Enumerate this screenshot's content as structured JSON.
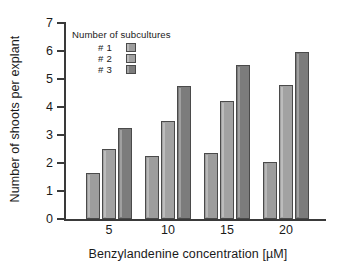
{
  "chart_data": {
    "type": "bar",
    "title": "",
    "xlabel": "Benzylandenine concentration [µM]",
    "ylabel": "Number of shoots per explant",
    "categories": [
      "5",
      "10",
      "15",
      "20"
    ],
    "series": [
      {
        "name": "# 1",
        "values": [
          1.65,
          2.25,
          2.35,
          2.05
        ],
        "color": "#9d9d9d"
      },
      {
        "name": "# 2",
        "values": [
          2.5,
          3.5,
          4.2,
          4.8
        ],
        "color": "#a2a2a2"
      },
      {
        "name": "# 3",
        "values": [
          3.25,
          4.75,
          5.5,
          5.95
        ],
        "color": "#7c7c7c"
      }
    ],
    "ylim": [
      0,
      7
    ],
    "yticks": [
      "0",
      "1",
      "2",
      "3",
      "4",
      "5",
      "6",
      "7"
    ],
    "grid": false,
    "legend": {
      "title": "Number of subcultures",
      "position": "upper-left-inside",
      "entries": [
        "# 1",
        "# 2",
        "# 3"
      ]
    }
  }
}
